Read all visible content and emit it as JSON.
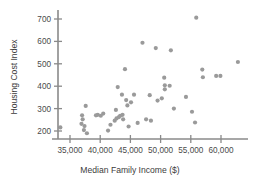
{
  "chart_data": {
    "type": "scatter",
    "title": "",
    "xlabel": "Median Family Income ($)",
    "ylabel": "Housing Cost Index",
    "xlim": [
      32500,
      64500
    ],
    "ylim": [
      160,
      740
    ],
    "grid": false,
    "legend": "none",
    "xticks": [
      35000,
      40000,
      45000,
      50000,
      55000,
      60000
    ],
    "xticklabels": [
      "35,000",
      "40,000",
      "45,000",
      "50,000",
      "55,000",
      "60,000"
    ],
    "yticks": [
      200,
      300,
      400,
      500,
      600,
      700
    ],
    "yticklabels": [
      "200",
      "300",
      "400",
      "500",
      "600",
      "700"
    ],
    "marker": {
      "shape": "circle",
      "color": "#9a9a9a",
      "size": 2.1
    },
    "points": [
      {
        "x": 33400,
        "y": 216
      },
      {
        "x": 36900,
        "y": 232
      },
      {
        "x": 37000,
        "y": 270
      },
      {
        "x": 37100,
        "y": 252
      },
      {
        "x": 37300,
        "y": 204
      },
      {
        "x": 37400,
        "y": 222
      },
      {
        "x": 37600,
        "y": 312
      },
      {
        "x": 37800,
        "y": 190
      },
      {
        "x": 39300,
        "y": 270
      },
      {
        "x": 39600,
        "y": 272
      },
      {
        "x": 40100,
        "y": 268
      },
      {
        "x": 40500,
        "y": 278
      },
      {
        "x": 41300,
        "y": 202
      },
      {
        "x": 41700,
        "y": 228
      },
      {
        "x": 42400,
        "y": 246
      },
      {
        "x": 42600,
        "y": 294
      },
      {
        "x": 42700,
        "y": 256
      },
      {
        "x": 42900,
        "y": 396
      },
      {
        "x": 43100,
        "y": 262
      },
      {
        "x": 43300,
        "y": 268
      },
      {
        "x": 43600,
        "y": 362
      },
      {
        "x": 43700,
        "y": 272
      },
      {
        "x": 43800,
        "y": 252
      },
      {
        "x": 44100,
        "y": 476
      },
      {
        "x": 44300,
        "y": 338
      },
      {
        "x": 44500,
        "y": 314
      },
      {
        "x": 44700,
        "y": 220
      },
      {
        "x": 45100,
        "y": 328
      },
      {
        "x": 45600,
        "y": 362
      },
      {
        "x": 46200,
        "y": 236
      },
      {
        "x": 47000,
        "y": 594
      },
      {
        "x": 47600,
        "y": 252
      },
      {
        "x": 48200,
        "y": 360
      },
      {
        "x": 48400,
        "y": 246
      },
      {
        "x": 49200,
        "y": 570
      },
      {
        "x": 49500,
        "y": 336
      },
      {
        "x": 50200,
        "y": 346
      },
      {
        "x": 50600,
        "y": 438
      },
      {
        "x": 50700,
        "y": 404
      },
      {
        "x": 50700,
        "y": 386
      },
      {
        "x": 51500,
        "y": 402
      },
      {
        "x": 51700,
        "y": 560
      },
      {
        "x": 52200,
        "y": 300
      },
      {
        "x": 54200,
        "y": 352
      },
      {
        "x": 55200,
        "y": 286
      },
      {
        "x": 55700,
        "y": 238
      },
      {
        "x": 55900,
        "y": 706
      },
      {
        "x": 56900,
        "y": 474
      },
      {
        "x": 57000,
        "y": 440
      },
      {
        "x": 59200,
        "y": 446
      },
      {
        "x": 59900,
        "y": 446
      },
      {
        "x": 62800,
        "y": 508
      }
    ]
  },
  "axes": {
    "x_axis_name": "x-axis",
    "y_axis_name": "y-axis"
  }
}
